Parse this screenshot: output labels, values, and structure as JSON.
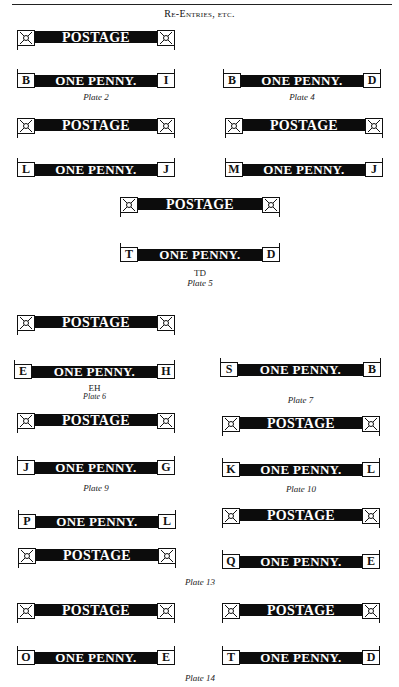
{
  "page": {
    "header": "Re-Entries, etc.",
    "words": {
      "postage": "POSTAGE",
      "penny": "ONE PENNY."
    },
    "captions": {
      "plate2": "Plate 2",
      "plate4": "Plate 4",
      "plate5_sub": "TD",
      "plate5": "Plate 5",
      "plate6_sub": "EH",
      "plate6": "Plate 6",
      "plate7": "Plate 7",
      "plate9": "Plate 9",
      "plate10": "Plate 10",
      "plate13": "Plate 13",
      "plate14": "Plate 14"
    },
    "letters": {
      "p2": [
        "B",
        "I"
      ],
      "p4": [
        "B",
        "D"
      ],
      "p3a": [
        "L",
        "J"
      ],
      "p3b": [
        "M",
        "J"
      ],
      "p5": [
        "T",
        "D"
      ],
      "p6": [
        "E",
        "H"
      ],
      "p7": [
        "S",
        "B"
      ],
      "p9": [
        "J",
        "G"
      ],
      "p10": [
        "K",
        "L"
      ],
      "p13a": [
        "P",
        "L"
      ],
      "p13b": [
        "Q",
        "E"
      ],
      "p14a": [
        "O",
        "E"
      ],
      "p14b": [
        "T",
        "D"
      ]
    }
  }
}
